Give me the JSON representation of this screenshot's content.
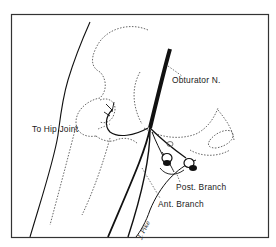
{
  "figure": {
    "labels": {
      "obturator_nerve": "Obturator N.",
      "to_hip_joint": "To Hip Joint",
      "posterior_branch": "Post. Branch",
      "anterior_branch": "Ant. Branch"
    },
    "signature": "J. Pike",
    "colors": {
      "ink": "#111111",
      "dotted": "#555555",
      "frame": "#333333",
      "background": "#ffffff"
    }
  }
}
